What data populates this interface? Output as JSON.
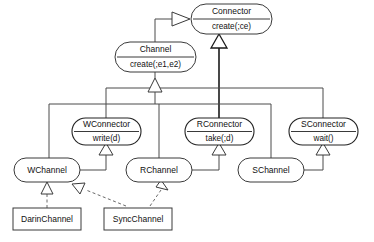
{
  "diagram": {
    "type": "uml-class-diagram",
    "background_color": "#ffffff",
    "stroke_color": "#3a3a3a",
    "text_color": "#111111"
  },
  "nodes": {
    "connector": {
      "name": "Connector",
      "operation": "create(;ce)",
      "shape": "rounded-two-compartment",
      "x": 191,
      "y": 4,
      "w": 81,
      "h": 30
    },
    "channel": {
      "name": "Channel",
      "operation": "create(;e1,e2)",
      "shape": "rounded-two-compartment",
      "x": 115,
      "y": 42,
      "w": 81,
      "h": 30
    },
    "wconnector": {
      "name": "WConnector",
      "operation": "write(d)",
      "shape": "rounded-two-compartment",
      "x": 75,
      "y": 118,
      "w": 63,
      "h": 27
    },
    "rconnector": {
      "name": "RConnector",
      "operation": "take(;d)",
      "shape": "rounded-two-compartment",
      "x": 187,
      "y": 118,
      "w": 63,
      "h": 27
    },
    "sconnector": {
      "name": "SConnector",
      "operation": "wait()",
      "shape": "rounded-two-compartment",
      "x": 292,
      "y": 118,
      "w": 63,
      "h": 27
    },
    "wchannel": {
      "name": "WChannel",
      "shape": "rounded",
      "x": 14,
      "y": 158,
      "w": 66,
      "h": 23
    },
    "rchannel": {
      "name": "RChannel",
      "shape": "rounded",
      "x": 126,
      "y": 158,
      "w": 66,
      "h": 23
    },
    "schannel": {
      "name": "SChannel",
      "shape": "rounded",
      "x": 238,
      "y": 158,
      "w": 66,
      "h": 23
    },
    "darinchannel": {
      "name": "DarinChannel",
      "shape": "rectangle",
      "x": 13,
      "y": 208,
      "w": 68,
      "h": 22
    },
    "syncchannel": {
      "name": "SyncChannel",
      "shape": "rectangle",
      "x": 104,
      "y": 208,
      "w": 68,
      "h": 22
    }
  },
  "edges": [
    {
      "from": "channel",
      "to": "connector",
      "kind": "generalization",
      "arrow": "hollow-triangle"
    },
    {
      "from": "wconnector",
      "to": "connector",
      "kind": "generalization",
      "arrow": "hollow-triangle"
    },
    {
      "from": "rconnector",
      "to": "connector",
      "kind": "generalization",
      "arrow": "hollow-triangle"
    },
    {
      "from": "sconnector",
      "to": "connector",
      "kind": "generalization",
      "arrow": "hollow-triangle"
    },
    {
      "from": "wchannel",
      "to": "channel",
      "kind": "generalization",
      "arrow": "hollow-triangle"
    },
    {
      "from": "rchannel",
      "to": "channel",
      "kind": "generalization",
      "arrow": "hollow-triangle"
    },
    {
      "from": "schannel",
      "to": "channel",
      "kind": "generalization",
      "arrow": "hollow-triangle"
    },
    {
      "from": "wchannel",
      "to": "wconnector",
      "kind": "generalization",
      "arrow": "hollow-triangle"
    },
    {
      "from": "rchannel",
      "to": "rconnector",
      "kind": "generalization",
      "arrow": "hollow-triangle"
    },
    {
      "from": "schannel",
      "to": "sconnector",
      "kind": "generalization",
      "arrow": "hollow-triangle"
    },
    {
      "from": "darinchannel",
      "to": "wchannel",
      "kind": "realization",
      "arrow": "hollow-triangle-dashed"
    },
    {
      "from": "syncchannel",
      "to": "wchannel",
      "kind": "realization",
      "arrow": "hollow-triangle-dashed"
    },
    {
      "from": "syncchannel",
      "to": "rchannel",
      "kind": "realization",
      "arrow": "hollow-triangle-dashed"
    }
  ]
}
